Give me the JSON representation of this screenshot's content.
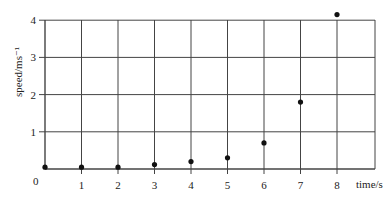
{
  "chart_data": {
    "type": "scatter",
    "title": "",
    "xlabel": "time/s",
    "ylabel": "speed/ms⁻¹",
    "x": [
      0,
      1,
      2,
      3,
      4,
      5,
      6,
      7,
      8
    ],
    "series": [
      {
        "name": "speed",
        "values": [
          0.05,
          0.05,
          0.05,
          0.12,
          0.2,
          0.3,
          0.7,
          1.8,
          4.15
        ]
      }
    ],
    "xlim": [
      0,
      8.5
    ],
    "ylim": [
      0,
      4.2
    ],
    "xticks": [
      "0",
      "1",
      "2",
      "3",
      "4",
      "5",
      "6",
      "7",
      "8"
    ],
    "yticks": [
      "1",
      "2",
      "3",
      "4"
    ],
    "origin_label": "0",
    "grid": true,
    "legend": null
  },
  "colors": {
    "grid": "#444444",
    "point": "#111111",
    "text": "#222222"
  }
}
